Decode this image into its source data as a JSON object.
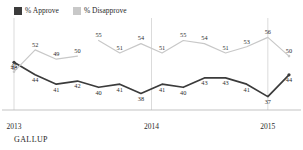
{
  "legend": {
    "items": [
      {
        "label": "% Approve",
        "color": "#3b3b3b",
        "icon": "square-swatch-icon"
      },
      {
        "label": "% Disapprove",
        "color": "#c8c8c8",
        "icon": "square-swatch-icon"
      }
    ]
  },
  "source": "GALLUP",
  "chart_data": {
    "type": "line",
    "title": "",
    "subtitle": "",
    "xlabel": "",
    "ylabel": "",
    "grid": false,
    "legend_position": "top-left",
    "xlim": [
      0,
      13
    ],
    "ylim": [
      34,
      59
    ],
    "xticks": [
      "2013",
      "2014",
      "2015"
    ],
    "xtick_positions": [
      0,
      6.5,
      12.0
    ],
    "annotations": [
      "Disapprove line has a break between points 3 and 4"
    ],
    "series": [
      {
        "name": "% Approve",
        "color": "#3b3b3b",
        "values": [
          48,
          44,
          41,
          42,
          40,
          41,
          38,
          41,
          40,
          43,
          43,
          41,
          37,
          44
        ],
        "label_side": "below"
      },
      {
        "name": "% Disapprove",
        "color": "#c8c8c8",
        "values": [
          45,
          52,
          49,
          50,
          55,
          51,
          54,
          51,
          55,
          54,
          51,
          53,
          56,
          50
        ],
        "label_side": "above"
      }
    ]
  }
}
